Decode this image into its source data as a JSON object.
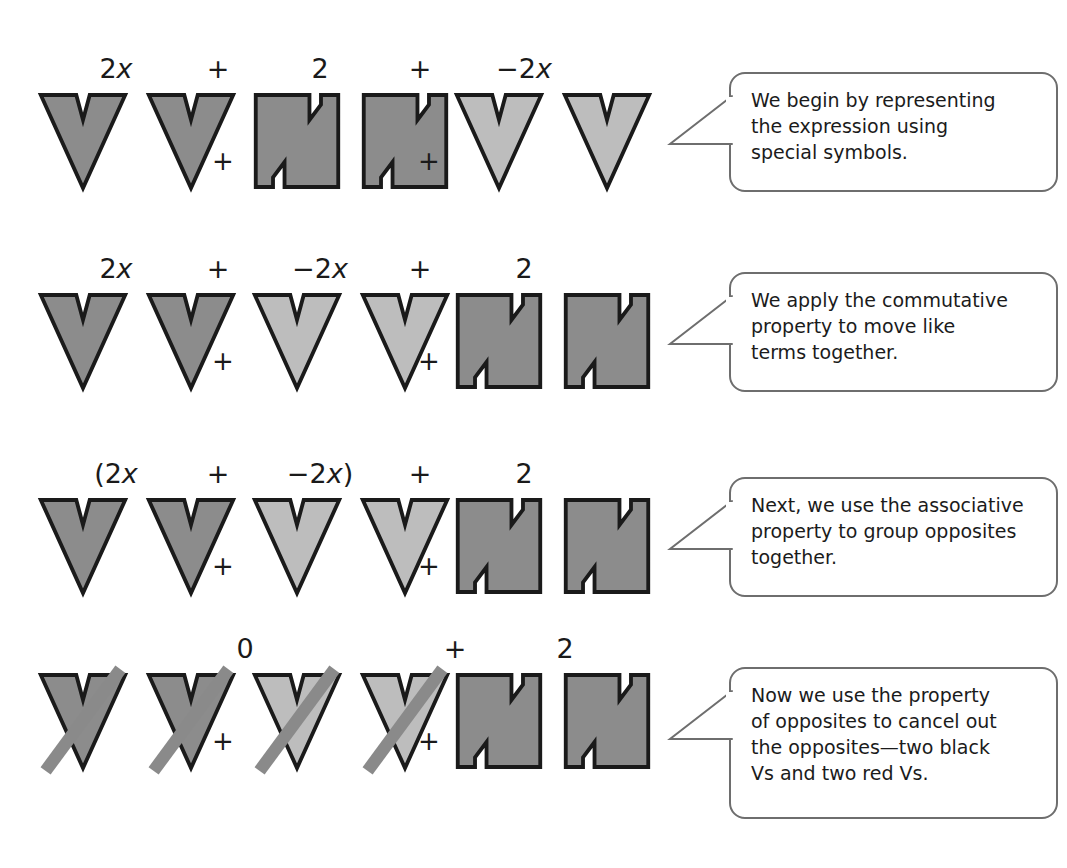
{
  "heading": "Applying Properties",
  "colors": {
    "dark_shape_fill": "#8c8c8c",
    "light_shape_fill": "#bdbdbd",
    "shape_outline": "#1a1a1a",
    "strike_bar": "#8a8a8a",
    "bubble_border": "#6e6e6e",
    "bubble_fill": "#ffffff",
    "text": "#1a1a1a"
  },
  "rows": [
    {
      "id": "row-1",
      "labels": [
        {
          "text": "2x",
          "html": "2<i>x</i>"
        },
        {
          "text": "+",
          "html": "+"
        },
        {
          "text": "2",
          "html": "2"
        },
        {
          "text": "+",
          "html": "+"
        },
        {
          "text": "−2x",
          "html": "−2<i>x</i>"
        }
      ],
      "groups": [
        {
          "kind": "v",
          "shade": "dark",
          "count": 2,
          "struck": false
        },
        {
          "kind": "n",
          "shade": "dark",
          "count": 2,
          "struck": false
        },
        {
          "kind": "v",
          "shade": "light",
          "count": 2,
          "struck": false
        }
      ],
      "operators": [
        "+",
        "+"
      ],
      "callout": "We begin by representing\nthe expression using\nspecial symbols."
    },
    {
      "id": "row-2",
      "labels": [
        {
          "text": "2x",
          "html": "2<i>x</i>"
        },
        {
          "text": "+",
          "html": "+"
        },
        {
          "text": "−2x",
          "html": "−2<i>x</i>"
        },
        {
          "text": "+",
          "html": "+"
        },
        {
          "text": "2",
          "html": "2"
        }
      ],
      "groups": [
        {
          "kind": "v",
          "shade": "dark",
          "count": 2,
          "struck": false
        },
        {
          "kind": "v",
          "shade": "light",
          "count": 2,
          "struck": false
        },
        {
          "kind": "n",
          "shade": "dark",
          "count": 2,
          "struck": false
        }
      ],
      "operators": [
        "+",
        "+"
      ],
      "callout": "We apply the commutative\nproperty to move like\nterms together."
    },
    {
      "id": "row-3",
      "labels": [
        {
          "text": "(2x",
          "html": "(2<i>x</i>"
        },
        {
          "text": "+",
          "html": "+"
        },
        {
          "text": "−2x)",
          "html": "−2<i>x</i>)"
        },
        {
          "text": "+",
          "html": "+"
        },
        {
          "text": "2",
          "html": "2"
        }
      ],
      "groups": [
        {
          "kind": "v",
          "shade": "dark",
          "count": 2,
          "struck": false
        },
        {
          "kind": "v",
          "shade": "light",
          "count": 2,
          "struck": false
        },
        {
          "kind": "n",
          "shade": "dark",
          "count": 2,
          "struck": false
        }
      ],
      "operators": [
        "+",
        "+"
      ],
      "callout": "Next, we use the associative\nproperty to group opposites\ntogether."
    },
    {
      "id": "row-4",
      "labels": [
        {
          "text": "0",
          "html": "0"
        },
        {
          "text": "+",
          "html": "+"
        },
        {
          "text": "2",
          "html": "2"
        }
      ],
      "groups": [
        {
          "kind": "v",
          "shade": "dark",
          "count": 2,
          "struck": true
        },
        {
          "kind": "v",
          "shade": "light",
          "count": 2,
          "struck": true
        },
        {
          "kind": "n",
          "shade": "dark",
          "count": 2,
          "struck": false
        }
      ],
      "operators": [
        "+",
        "+"
      ],
      "callout": "Now we use the property\nof opposites to cancel out\nthe opposites—two black\nVs and two red Vs."
    }
  ]
}
